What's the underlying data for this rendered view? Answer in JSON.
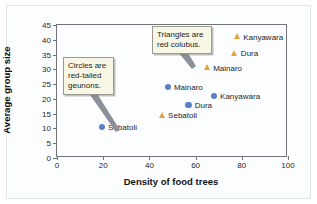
{
  "chart_data": {
    "type": "scatter",
    "title": "",
    "xlabel": "Density of food trees",
    "ylabel": "Average group size",
    "xlim": [
      0,
      100
    ],
    "ylim": [
      0,
      45
    ],
    "xticks": [
      0,
      20,
      40,
      60,
      80,
      100
    ],
    "yticks": [
      0,
      5,
      10,
      15,
      20,
      25,
      30,
      35,
      40,
      45
    ],
    "grid": false,
    "legend": "none",
    "series": [
      {
        "name": "red-tailed guenons",
        "marker": "circle",
        "color": "#5b7fc7",
        "points": [
          {
            "label": "Sebatoli",
            "x": 19.5,
            "y": 10.5
          },
          {
            "label": "Dura",
            "x": 57.0,
            "y": 18.0
          },
          {
            "label": "Kanyawara",
            "x": 68.0,
            "y": 21.0
          },
          {
            "label": "Mainaro",
            "x": 48.0,
            "y": 24.0
          }
        ]
      },
      {
        "name": "red colobus",
        "marker": "triangle",
        "color": "#e8a33d",
        "points": [
          {
            "label": "Sebatoli",
            "x": 45.5,
            "y": 14.5
          },
          {
            "label": "Mainaro",
            "x": 65.0,
            "y": 30.5
          },
          {
            "label": "Dura",
            "x": 77.0,
            "y": 35.5
          },
          {
            "label": "Kanyawara",
            "x": 78.0,
            "y": 41.0
          }
        ]
      }
    ],
    "annotations": [
      {
        "id": "circles",
        "text": "Circles are\nred-tailed\ngeunons."
      },
      {
        "id": "triangles",
        "text": "Triangles are\nred colubus."
      }
    ]
  },
  "colors": {
    "circle_marker": "#5b7fc7",
    "triangle_marker": "#e8a33d",
    "callout_fill": "#f8f6e4",
    "callout_border": "#9a9a92",
    "axis": "#6f7276",
    "leader_line": "#7a7f86"
  }
}
